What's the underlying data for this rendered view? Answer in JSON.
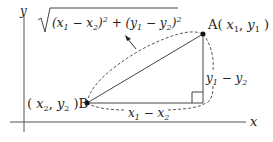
{
  "diagram": {
    "axes": {
      "x_label": "x",
      "y_label": "y"
    },
    "points": {
      "A": {
        "name": "A",
        "coords_label": "( x1, y1 )"
      },
      "B": {
        "name": "B",
        "coords_label": "( x2, y2 )"
      }
    },
    "labels": {
      "formula": "√((x1 − x2)² + (y1 − y2)²)",
      "horizontal_leg": "x1 − x2",
      "vertical_leg": "y1 − y2"
    },
    "colors": {
      "stroke": "#333333",
      "text": "#222222"
    }
  }
}
